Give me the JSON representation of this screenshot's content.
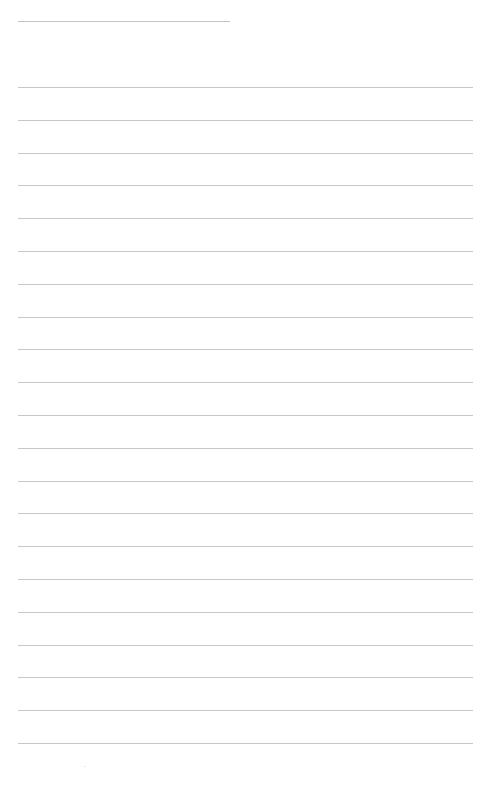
{
  "document": {
    "type": "lined-paper",
    "background_color": "#ffffff",
    "line_color": "#c8c8c8",
    "header_line": {
      "top": 21,
      "left": 18,
      "width": 212
    },
    "ruled_lines": {
      "count": 21,
      "first_top": 87,
      "spacing": 32.8,
      "left": 18,
      "width": 455
    },
    "lines_text": [
      "",
      "",
      "",
      "",
      "",
      "",
      "",
      "",
      "",
      "",
      "",
      "",
      "",
      "",
      "",
      "",
      "",
      "",
      "",
      "",
      ""
    ]
  }
}
